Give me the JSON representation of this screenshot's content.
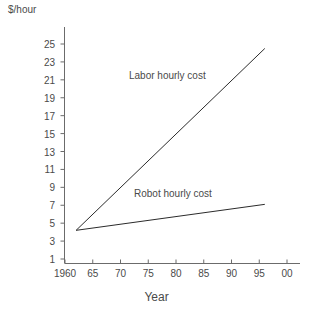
{
  "chart_data": {
    "type": "line",
    "title": "",
    "xlabel": "Year",
    "ylabel": "$/hour",
    "xlim": [
      1960,
      2000
    ],
    "ylim": [
      0,
      26
    ],
    "grid": false,
    "legend_position": "inline-annotations",
    "x_tick_labels": [
      "1960",
      "65",
      "70",
      "75",
      "80",
      "85",
      "90",
      "95",
      "00"
    ],
    "x_tick_values": [
      1960,
      1965,
      1970,
      1975,
      1980,
      1985,
      1990,
      1995,
      2000
    ],
    "y_tick_labels": [
      "1",
      "3",
      "5",
      "7",
      "9",
      "11",
      "13",
      "15",
      "17",
      "19",
      "21",
      "23",
      "25"
    ],
    "y_tick_values": [
      1,
      3,
      5,
      7,
      9,
      11,
      13,
      15,
      17,
      19,
      21,
      23,
      25
    ],
    "series": [
      {
        "name": "Labor hourly cost",
        "color": "#2b2b2b",
        "x": [
          1962,
          1996
        ],
        "values": [
          4.2,
          24.5
        ]
      },
      {
        "name": "Robot hourly cost",
        "color": "#2b2b2b",
        "x": [
          1962,
          1996
        ],
        "values": [
          4.2,
          7.1
        ]
      }
    ],
    "annotations": [
      {
        "text": "Labor hourly cost",
        "x": 1972,
        "y": 21
      },
      {
        "text": "Robot hourly cost",
        "x": 1973,
        "y": 8
      }
    ]
  },
  "axis": {
    "y_title": "$/hour",
    "x_title": "Year"
  },
  "colors": {
    "background": "#ffffff",
    "axis": "#6b6b6b",
    "line": "#2b2b2b",
    "text": "#4a4a4a"
  }
}
